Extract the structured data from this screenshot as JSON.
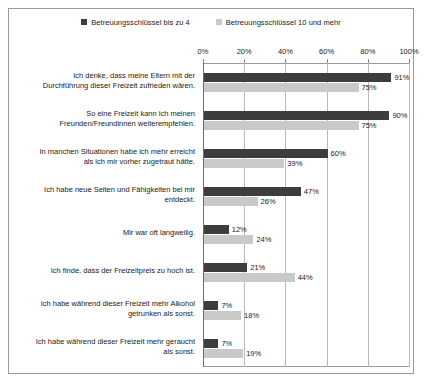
{
  "legend": {
    "items": [
      {
        "label": "Betreuungsschlüssel bis zu 4",
        "color": "#3d3d3d",
        "swatch": "dark"
      },
      {
        "label": "Betreuungsschlüssel 10 und mehr",
        "color": "#c9c9c9",
        "swatch": "light"
      }
    ]
  },
  "axis": {
    "ticks": [
      "0%",
      "20%",
      "40%",
      "60%",
      "80%",
      "100%"
    ]
  },
  "chart_data": {
    "type": "bar",
    "orientation": "horizontal",
    "title": "",
    "xlabel": "",
    "ylabel": "",
    "xlim": [
      0,
      100
    ],
    "xticks": [
      0,
      20,
      40,
      60,
      80,
      100
    ],
    "xtick_labels": [
      "0%",
      "20%",
      "40%",
      "60%",
      "80%",
      "100%"
    ],
    "grid": true,
    "legend_position": "top-center",
    "categories": [
      "Ich denke, dass meine Eltern mit der Durchführung dieser Freizeit zufrieden wären.",
      "So eine Freizeit kann ich meinen Freunden/Freundinnen weiterempfehlen.",
      "In manchen Situationen habe ich mehr erreicht als ich mir vorher zugetraut hätte.",
      "Ich habe neue Seiten und Fähigkeiten bei mir entdeckt.",
      "Mir war oft langweilig.",
      "Ich finde, dass der Freizeitpreis zu hoch ist.",
      "Ich habe während dieser Freizeit mehr Alkohol getrunken als sonst.",
      "Ich habe während dieser Freizeit mehr geraucht als sonst."
    ],
    "category_lines": [
      [
        "Ich denke, dass meine Eltern mit der",
        "Durchführung dieser Freizeit zufrieden wären."
      ],
      [
        "So eine Freizeit kann ich meinen",
        "Freunden/Freundinnen weiterempfehlen."
      ],
      [
        "In manchen Situationen habe ich mehr erreicht",
        "als ich mir vorher zugetraut hätte."
      ],
      [
        "Ich habe neue Seiten und Fähigkeiten bei mir",
        "entdeckt."
      ],
      [
        "Mir war oft langweilig."
      ],
      [
        "Ich finde, dass der Freizeitpreis zu hoch ist."
      ],
      [
        "Ich habe während dieser Freizeit mehr Alkohol",
        "getrunken als sonst."
      ],
      [
        "Ich habe während dieser Freizeit mehr geraucht",
        "als sonst."
      ]
    ],
    "series": [
      {
        "name": "Betreuungsschlüssel bis zu 4",
        "color": "#3d3d3d",
        "values": [
          91,
          90,
          60,
          47,
          12,
          21,
          7,
          7
        ],
        "labels": [
          "91%",
          "90%",
          "60%",
          "47%",
          "12%",
          "21%",
          "7%",
          "7%"
        ]
      },
      {
        "name": "Betreuungsschlüssel 10 und mehr",
        "color": "#c9c9c9",
        "values": [
          75,
          75,
          39,
          26,
          24,
          44,
          18,
          19
        ],
        "labels": [
          "75%",
          "75%",
          "39%",
          "26%",
          "24%",
          "44%",
          "18%",
          "19%"
        ]
      }
    ]
  }
}
